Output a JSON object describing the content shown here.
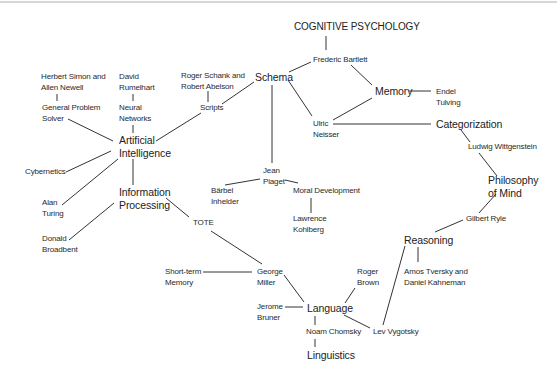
{
  "diagram": {
    "title": "COGNITIVE PSYCHOLOGY",
    "nodes": {
      "frederic_bartlett": [
        "Frederic Bartlett"
      ],
      "schema": [
        "Schema"
      ],
      "memory": [
        "Memory"
      ],
      "endel_tulving": [
        "Endel",
        "Tulving"
      ],
      "simon_newell": [
        "Herbert Simon and",
        "Allen Newell"
      ],
      "rumelhart": [
        "David",
        "Rumelhart"
      ],
      "schank_abelson": [
        "Roger Schank and",
        "Robert Abelson"
      ],
      "scripts": [
        "Scripts"
      ],
      "general_problem_solver": [
        "General Problem",
        "Solver"
      ],
      "neural_networks": [
        "Neural",
        "Networks"
      ],
      "artificial_intelligence": [
        "Artificial",
        "Intelligence"
      ],
      "ulric_neisser": [
        "Ulric",
        "Neisser"
      ],
      "categorization": [
        "Categorization"
      ],
      "wittgenstein": [
        "Ludwig Wittgenstein"
      ],
      "cybernetics": [
        "Cybernetics"
      ],
      "jean_piaget": [
        "Jean",
        "Piaget"
      ],
      "philosophy_of_mind": [
        "Philosophy",
        "of Mind"
      ],
      "information_processing": [
        "Information",
        "Processing"
      ],
      "alan_turing": [
        "Alan",
        "Turing"
      ],
      "barbel_inhelder": [
        "Bärbel",
        "Inhelder"
      ],
      "moral_development": [
        "Moral Development"
      ],
      "tote": [
        "TOTE"
      ],
      "gilbert_ryle": [
        "Gilbert Ryle"
      ],
      "lawrence_kohlberg": [
        "Lawrence",
        "Kohlberg"
      ],
      "reasoning": [
        "Reasoning"
      ],
      "donald_broadbent": [
        "Donald",
        "Broadbent"
      ],
      "short_term_memory": [
        "Short-term",
        "Memory"
      ],
      "george_miller": [
        "George",
        "Miller"
      ],
      "roger_brown": [
        "Roger",
        "Brown"
      ],
      "tversky_kahneman": [
        "Amos Tversky and",
        "Daniel Kahneman"
      ],
      "jerome_bruner": [
        "Jerome",
        "Bruner"
      ],
      "language": [
        "Language"
      ],
      "lev_vygotsky": [
        "Lev Vygotsky"
      ],
      "noam_chomsky": [
        "Noam Chomsky"
      ],
      "linguistics": [
        "Linguistics"
      ]
    },
    "edges": [
      [
        "COGNITIVE PSYCHOLOGY",
        "Frederic Bartlett"
      ],
      [
        "Frederic Bartlett",
        "Schema"
      ],
      [
        "Frederic Bartlett",
        "Memory"
      ],
      [
        "Memory",
        "Endel Tulving"
      ],
      [
        "Memory",
        "Ulric Neisser"
      ],
      [
        "Schema",
        "Ulric Neisser"
      ],
      [
        "Schema",
        "Scripts"
      ],
      [
        "Schema",
        "Jean Piaget"
      ],
      [
        "Ulric Neisser",
        "Categorization"
      ],
      [
        "Categorization",
        "Ludwig Wittgenstein"
      ],
      [
        "Ludwig Wittgenstein",
        "Philosophy of Mind"
      ],
      [
        "Philosophy of Mind",
        "Gilbert Ryle"
      ],
      [
        "Gilbert Ryle",
        "Reasoning"
      ],
      [
        "Reasoning",
        "Amos Tversky and Daniel Kahneman"
      ],
      [
        "Reasoning",
        "Lev Vygotsky"
      ],
      [
        "Roger Schank and Robert Abelson",
        "Scripts"
      ],
      [
        "Scripts",
        "Artificial Intelligence"
      ],
      [
        "Herbert Simon and Allen Newell",
        "General Problem Solver"
      ],
      [
        "General Problem Solver",
        "Artificial Intelligence"
      ],
      [
        "David Rumelhart",
        "Neural Networks"
      ],
      [
        "Neural Networks",
        "Artificial Intelligence"
      ],
      [
        "Artificial Intelligence",
        "Cybernetics"
      ],
      [
        "Artificial Intelligence",
        "Alan Turing"
      ],
      [
        "Artificial Intelligence",
        "Information Processing"
      ],
      [
        "Information Processing",
        "Donald Broadbent"
      ],
      [
        "Information Processing",
        "TOTE"
      ],
      [
        "TOTE",
        "George Miller"
      ],
      [
        "Short-term Memory",
        "George Miller"
      ],
      [
        "George Miller",
        "Language"
      ],
      [
        "Jerome Bruner",
        "Language"
      ],
      [
        "Roger Brown",
        "Language"
      ],
      [
        "Language",
        "Lev Vygotsky"
      ],
      [
        "Language",
        "Noam Chomsky"
      ],
      [
        "Noam Chomsky",
        "Linguistics"
      ],
      [
        "Jean Piaget",
        "Bärbel Inhelder"
      ],
      [
        "Jean Piaget",
        "Moral Development"
      ],
      [
        "Moral Development",
        "Lawrence Kohlberg"
      ]
    ]
  }
}
